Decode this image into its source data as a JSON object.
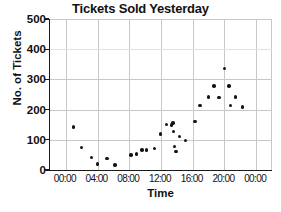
{
  "chart_data": {
    "type": "scatter",
    "title": "Tickets Sold Yesterday",
    "xlabel": "Time",
    "ylabel": "No. of Tickets",
    "grid": true,
    "legend": null,
    "ylim": [
      0,
      500
    ],
    "yticks": [
      0,
      100,
      200,
      300,
      400,
      500
    ],
    "ytick_labels": [
      "0",
      "100",
      "200",
      "300",
      "400",
      "500"
    ],
    "xlim_hours": [
      -2,
      26
    ],
    "xticks_hours": [
      0,
      4,
      8,
      12,
      16,
      20,
      24
    ],
    "xtick_labels": [
      "00:00",
      "04:00",
      "08:00",
      "12:00",
      "16:00",
      "20:00",
      "00:00"
    ],
    "series": [
      {
        "name": "Tickets sold",
        "marker": "circle",
        "color": "#141414",
        "points": [
          {
            "x_hours": 1.0,
            "x_label": "01:00",
            "y": 143
          },
          {
            "x_hours": 2.0,
            "x_label": "02:00",
            "y": 74
          },
          {
            "x_hours": 3.2,
            "x_label": "03:12",
            "y": 42
          },
          {
            "x_hours": 4.0,
            "x_label": "04:00",
            "y": 20
          },
          {
            "x_hours": 5.2,
            "x_label": "05:12",
            "y": 38
          },
          {
            "x_hours": 6.2,
            "x_label": "06:12",
            "y": 16
          },
          {
            "x_hours": 8.2,
            "x_label": "08:12",
            "y": 50
          },
          {
            "x_hours": 8.9,
            "x_label": "08:54",
            "y": 53
          },
          {
            "x_hours": 9.6,
            "x_label": "09:36",
            "y": 66
          },
          {
            "x_hours": 10.2,
            "x_label": "10:12",
            "y": 66
          },
          {
            "x_hours": 11.2,
            "x_label": "11:12",
            "y": 72
          },
          {
            "x_hours": 11.9,
            "x_label": "11:54",
            "y": 119
          },
          {
            "x_hours": 12.7,
            "x_label": "12:42",
            "y": 150
          },
          {
            "x_hours": 13.3,
            "x_label": "13:18",
            "y": 149
          },
          {
            "x_hours": 13.5,
            "x_label": "13:30",
            "y": 156
          },
          {
            "x_hours": 13.6,
            "x_label": "13:36",
            "y": 127
          },
          {
            "x_hours": 13.7,
            "x_label": "13:42",
            "y": 78
          },
          {
            "x_hours": 13.9,
            "x_label": "13:54",
            "y": 61
          },
          {
            "x_hours": 14.3,
            "x_label": "14:18",
            "y": 111
          },
          {
            "x_hours": 15.1,
            "x_label": "15:06",
            "y": 97
          },
          {
            "x_hours": 16.3,
            "x_label": "16:18",
            "y": 161
          },
          {
            "x_hours": 16.9,
            "x_label": "16:54",
            "y": 214
          },
          {
            "x_hours": 18.0,
            "x_label": "18:00",
            "y": 242
          },
          {
            "x_hours": 18.7,
            "x_label": "18:42",
            "y": 278
          },
          {
            "x_hours": 19.3,
            "x_label": "19:18",
            "y": 241
          },
          {
            "x_hours": 20.0,
            "x_label": "20:00",
            "y": 337
          },
          {
            "x_hours": 20.6,
            "x_label": "20:36",
            "y": 278
          },
          {
            "x_hours": 20.8,
            "x_label": "20:48",
            "y": 214
          },
          {
            "x_hours": 21.4,
            "x_label": "21:24",
            "y": 242
          },
          {
            "x_hours": 22.3,
            "x_label": "22:18",
            "y": 208
          }
        ]
      }
    ]
  }
}
